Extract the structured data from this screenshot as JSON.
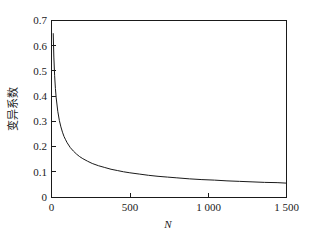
{
  "chart_data": {
    "type": "line",
    "title": "",
    "subtitle": "",
    "xlabel": "N",
    "ylabel": "变异系数",
    "xlim": [
      0,
      1500
    ],
    "ylim": [
      0,
      0.7
    ],
    "grid": false,
    "legend": null,
    "legend_position": "none",
    "xticks": [
      0,
      500,
      1000,
      1500
    ],
    "xtick_labels": [
      "0",
      "500",
      "1 000",
      "1 500"
    ],
    "yticks": [
      0,
      0.1,
      0.2,
      0.3,
      0.4,
      0.5,
      0.6,
      0.7
    ],
    "ytick_labels": [
      "0",
      "0.1",
      "0.2",
      "0.3",
      "0.4",
      "0.5",
      "0.6",
      "0.7"
    ],
    "series": [
      {
        "name": "变异系数",
        "color": "#1a1a1a",
        "x": [
          11,
          15,
          20,
          25,
          30,
          40,
          50,
          60,
          70,
          80,
          90,
          100,
          120,
          140,
          160,
          180,
          200,
          230,
          260,
          300,
          340,
          380,
          420,
          460,
          500,
          560,
          620,
          680,
          740,
          800,
          880,
          960,
          1040,
          1120,
          1200,
          1280,
          1360,
          1440,
          1500
        ],
        "y": [
          0.648,
          0.555,
          0.481,
          0.43,
          0.393,
          0.34,
          0.304,
          0.278,
          0.257,
          0.24,
          0.227,
          0.215,
          0.196,
          0.182,
          0.17,
          0.16,
          0.152,
          0.142,
          0.133,
          0.124,
          0.117,
          0.11,
          0.105,
          0.1,
          0.096,
          0.091,
          0.086,
          0.082,
          0.079,
          0.076,
          0.072,
          0.069,
          0.067,
          0.064,
          0.062,
          0.06,
          0.058,
          0.057,
          0.055
        ]
      }
    ],
    "annotations": []
  },
  "axes": {
    "x_axis_name": "N",
    "y_axis_name": "变异系数"
  },
  "colors": {
    "curve": "#1a1a1a",
    "axis": "#1a1a1a",
    "background": "#ffffff"
  }
}
